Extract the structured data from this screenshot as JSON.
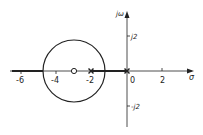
{
  "diagram": {
    "type": "root-locus",
    "axes": {
      "x_label": "σ",
      "y_label": "jω",
      "x_ticks": [
        {
          "value": -6,
          "label": "-6"
        },
        {
          "value": -4,
          "label": "-4"
        },
        {
          "value": -2,
          "label": "-2"
        },
        {
          "value": 0,
          "label": "0"
        },
        {
          "value": 2,
          "label": "2"
        }
      ],
      "y_ticks": [
        {
          "value": 2,
          "label": "j2"
        },
        {
          "value": -2,
          "label": "-j2"
        }
      ]
    },
    "poles": [
      {
        "real": -2,
        "imag": 0,
        "symbol": "x"
      },
      {
        "real": 0,
        "imag": 0,
        "symbol": "x"
      }
    ],
    "zeros": [
      {
        "real": -3,
        "imag": 0,
        "symbol": "o"
      }
    ],
    "locus": {
      "circle_center": -3,
      "circle_radius": 1.73,
      "real_axis_segments": [
        [
          -10,
          -4.73
        ],
        [
          -2,
          0
        ]
      ]
    },
    "colors": {
      "ink": "#222222",
      "background": "#ffffff"
    }
  }
}
